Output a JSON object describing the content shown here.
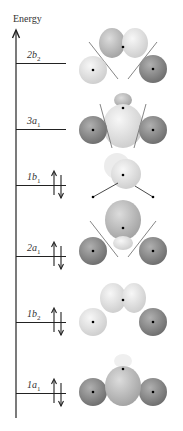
{
  "diagram": {
    "title": "Energy",
    "axis": {
      "direction": "up",
      "label": "Energy"
    },
    "levels": [
      {
        "name": "2b2",
        "main": "2b",
        "sub": "2",
        "occupied": false,
        "y": 63
      },
      {
        "name": "3a1",
        "main": "3a",
        "sub": "1",
        "occupied": false,
        "y": 129
      },
      {
        "name": "1b1",
        "main": "1b",
        "sub": "1",
        "occupied": true,
        "y": 185
      },
      {
        "name": "2a1",
        "main": "2a",
        "sub": "1",
        "occupied": true,
        "y": 256
      },
      {
        "name": "1b2",
        "main": "1b",
        "sub": "2",
        "occupied": true,
        "y": 322
      },
      {
        "name": "1a1",
        "main": "1a",
        "sub": "1",
        "occupied": true,
        "y": 393
      }
    ],
    "electron_symbol": "↑↓",
    "colors": {
      "light_lobe": "#e6e6e6",
      "mid_lobe": "#bdbdbd",
      "dark_lobe": "#8a8a8a",
      "axis": "#222222"
    }
  }
}
